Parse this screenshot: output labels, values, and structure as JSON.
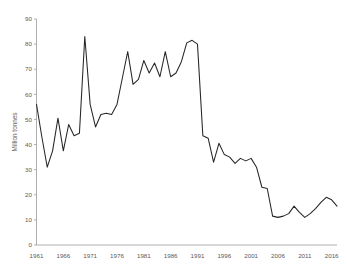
{
  "chart_data": {
    "type": "line",
    "title": "",
    "subtitle": "",
    "xlabel": "",
    "ylabel": "Million tonnes",
    "xlim": [
      1961,
      2017
    ],
    "ylim": [
      0,
      90
    ],
    "y_ticks": [
      0,
      10,
      20,
      30,
      40,
      50,
      60,
      70,
      80,
      90
    ],
    "x_ticks": [
      1961,
      1966,
      1971,
      1976,
      1981,
      1986,
      1991,
      1996,
      2001,
      2006,
      2011,
      2016
    ],
    "grid": false,
    "legend": null,
    "legend_position": "none",
    "line_color": "#262626",
    "axis_color": "#a6a6a6",
    "text_color": "#595959",
    "x": [
      1961,
      1962,
      1963,
      1964,
      1965,
      1966,
      1967,
      1968,
      1969,
      1970,
      1971,
      1972,
      1973,
      1974,
      1975,
      1976,
      1977,
      1978,
      1979,
      1980,
      1981,
      1982,
      1983,
      1984,
      1985,
      1986,
      1987,
      1988,
      1989,
      1990,
      1991,
      1992,
      1993,
      1994,
      1995,
      1996,
      1997,
      1998,
      1999,
      2000,
      2001,
      2002,
      2003,
      2004,
      2005,
      2006,
      2007,
      2008,
      2009,
      2010,
      2011,
      2012,
      2013,
      2014,
      2015,
      2016,
      2017
    ],
    "series": [
      {
        "name": "Million tonnes",
        "values": [
          56.0,
          43.0,
          31.0,
          37.5,
          50.5,
          37.5,
          48.0,
          43.5,
          44.5,
          83.0,
          56.0,
          47.0,
          52.0,
          52.5,
          52.0,
          56.0,
          66.5,
          77.0,
          64.0,
          66.0,
          73.5,
          68.5,
          72.5,
          67.0,
          77.0,
          67.0,
          68.5,
          73.0,
          80.5,
          81.5,
          80.0,
          43.5,
          42.5,
          33.0,
          40.5,
          36.0,
          35.0,
          32.5,
          34.5,
          33.5,
          34.5,
          31.0,
          23.0,
          22.5,
          11.5,
          11.0,
          11.5,
          12.5,
          15.5,
          13.0,
          11.0,
          12.5,
          14.5,
          17.0,
          19.0,
          18.0,
          15.5
        ]
      }
    ]
  }
}
